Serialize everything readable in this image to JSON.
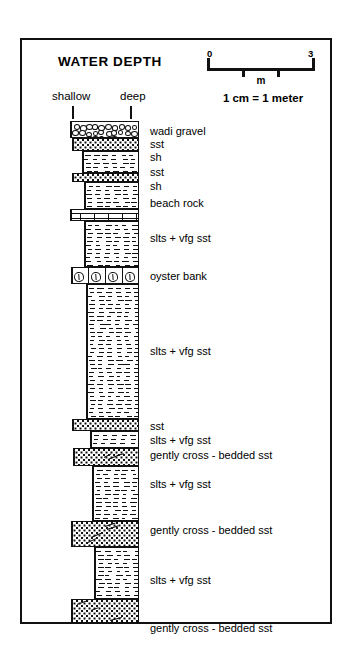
{
  "figure": {
    "title": "WATER DEPTH",
    "axis": {
      "left_label": "shallow",
      "right_label": "deep"
    },
    "scale": {
      "start": "0",
      "end": "3",
      "unit": "m",
      "caption": "1 cm = 1 meter",
      "ticks": [
        "0",
        "1",
        "2",
        "3"
      ]
    },
    "colors": {
      "ink": "#111111",
      "paper": "#ffffff"
    }
  },
  "column": {
    "beds": [
      {
        "label": "wadi gravel",
        "lithology": "conglomerate"
      },
      {
        "label": "sst",
        "lithology": "sandstone"
      },
      {
        "label": "sh",
        "lithology": "shale"
      },
      {
        "label": "sst",
        "lithology": "sandstone"
      },
      {
        "label": "sh",
        "lithology": "shale"
      },
      {
        "label": "beach rock",
        "lithology": "beach-rock"
      },
      {
        "label": "slts + vfg sst",
        "lithology": "siltstone"
      },
      {
        "label": "oyster bank",
        "lithology": "oyster-bank"
      },
      {
        "label": "slts + vfg sst",
        "lithology": "siltstone"
      },
      {
        "label": "sst",
        "lithology": "sandstone"
      },
      {
        "label": "slts + vfg sst",
        "lithology": "siltstone"
      },
      {
        "label": "gently cross - bedded sst",
        "lithology": "cross-bedded-sandstone"
      },
      {
        "label": "slts + vfg sst",
        "lithology": "siltstone"
      },
      {
        "label": "gently cross - bedded sst",
        "lithology": "cross-bedded-sandstone"
      },
      {
        "label": "slts + vfg sst",
        "lithology": "siltstone"
      },
      {
        "label": "gently cross - bedded sst",
        "lithology": "cross-bedded-sandstone"
      }
    ]
  }
}
